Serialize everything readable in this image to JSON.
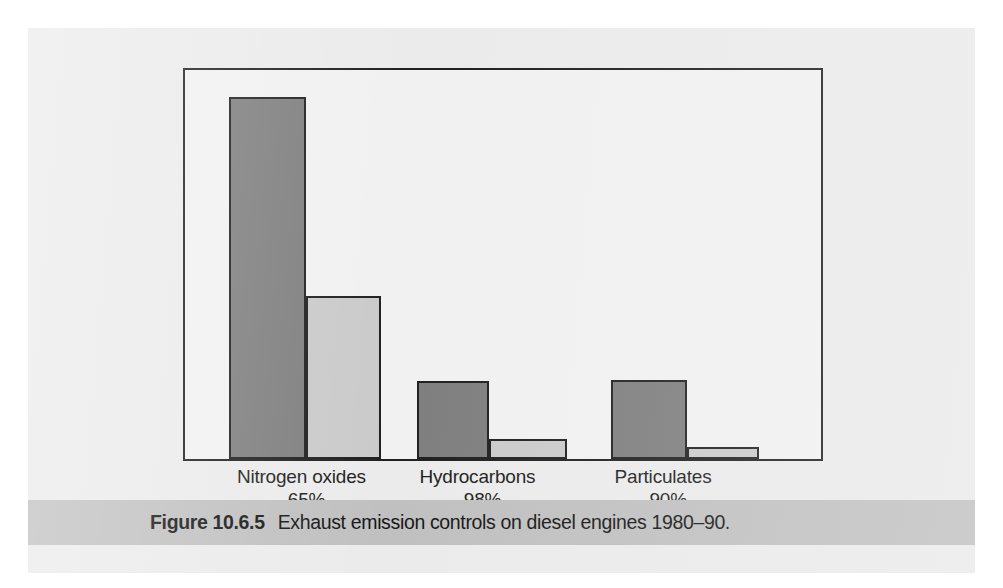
{
  "figure": {
    "caption_label": "Figure 10.6.5",
    "caption_text": "Exhaust emission controls on diesel engines 1980–90."
  },
  "colors": {
    "page_panel": "#ebebeb",
    "plot_background": "#f1f1f1",
    "frame_line": "#1f1f1f",
    "bar_before": "#7e7e7e",
    "bar_after": "#cacaca",
    "caption_band": "#c0c0c0",
    "text": "#1c1c1c"
  },
  "chart_data": {
    "type": "bar",
    "title": "Exhaust emission controls on diesel engines 1980–90",
    "xlabel": "",
    "ylabel": "",
    "grid": false,
    "legend_position": "none",
    "axis_frame": "box",
    "ylim": [
      0,
      100
    ],
    "categories": [
      "Nitrogen oxides",
      "Hydrocarbons",
      "Particulates"
    ],
    "category_annotations": [
      "–65%",
      "–98%",
      "–90%"
    ],
    "series": [
      {
        "name": "1980",
        "values": [
          93,
          20,
          20
        ]
      },
      {
        "name": "1990",
        "values": [
          42,
          5,
          3
        ]
      }
    ],
    "bars": [
      {
        "category": "Nitrogen oxides",
        "series": "1980",
        "value": 93,
        "left_pct": 6.9,
        "width_pct": 12.2,
        "height_pct": 93.0
      },
      {
        "category": "Nitrogen oxides",
        "series": "1990",
        "value": 42,
        "left_pct": 19.1,
        "width_pct": 11.7,
        "height_pct": 42.0
      },
      {
        "category": "Hydrocarbons",
        "series": "1980",
        "value": 20,
        "left_pct": 36.5,
        "width_pct": 11.3,
        "height_pct": 20.1
      },
      {
        "category": "Hydrocarbons",
        "series": "1990",
        "value": 5,
        "left_pct": 47.8,
        "width_pct": 12.2,
        "height_pct": 5.1
      },
      {
        "category": "Particulates",
        "series": "1980",
        "value": 20,
        "left_pct": 67.0,
        "width_pct": 11.9,
        "height_pct": 20.3
      },
      {
        "category": "Particulates",
        "series": "1990",
        "value": 3,
        "left_pct": 78.9,
        "width_pct": 11.3,
        "height_pct": 3.0
      }
    ],
    "category_label_centers_pct": [
      18.5,
      46.0,
      75.0
    ]
  }
}
